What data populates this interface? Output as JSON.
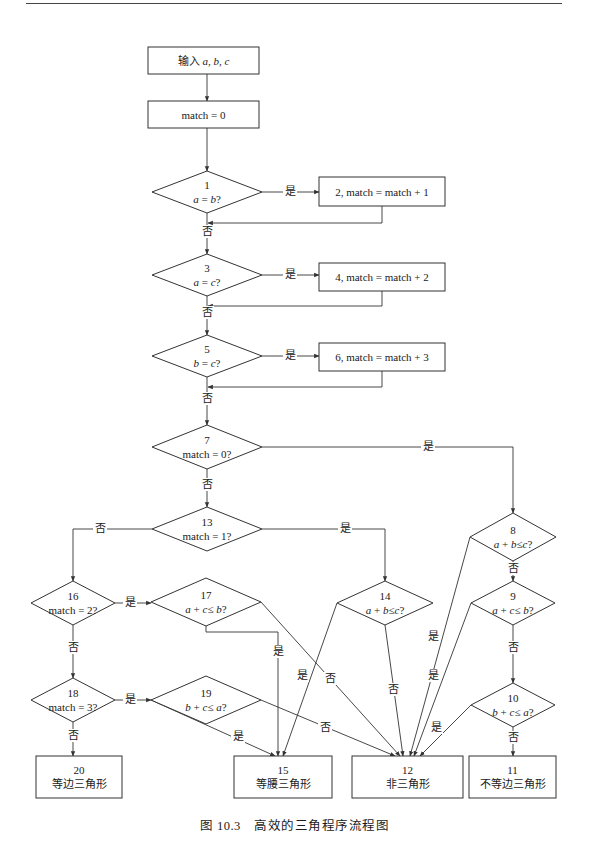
{
  "figure": {
    "caption": "图 10.3　高效的三角程序流程图"
  },
  "nodes": [
    {
      "id": "input",
      "type": "rect",
      "x": 148,
      "y": 47,
      "w": 111,
      "h": 27,
      "lines": [
        "输入 a, b, c"
      ]
    },
    {
      "id": "init",
      "type": "rect",
      "x": 148,
      "y": 101,
      "w": 111,
      "h": 27,
      "lines": [
        "match = 0"
      ]
    },
    {
      "id": "d1",
      "type": "diamond",
      "cx": 207,
      "cy": 192,
      "hw": 55,
      "hh": 21,
      "lines": [
        "1",
        "a = b?"
      ]
    },
    {
      "id": "p2",
      "type": "rect",
      "x": 319,
      "y": 177,
      "w": 126,
      "h": 29,
      "lines": [
        "2, match = match + 1"
      ]
    },
    {
      "id": "d3",
      "type": "diamond",
      "cx": 207,
      "cy": 275,
      "hw": 55,
      "hh": 21,
      "lines": [
        "3",
        "a = c?"
      ]
    },
    {
      "id": "p4",
      "type": "rect",
      "x": 319,
      "y": 263,
      "w": 126,
      "h": 28,
      "lines": [
        "4, match = match + 2"
      ]
    },
    {
      "id": "d5",
      "type": "diamond",
      "cx": 207,
      "cy": 356,
      "hw": 55,
      "hh": 21,
      "lines": [
        "5",
        "b = c?"
      ]
    },
    {
      "id": "p6",
      "type": "rect",
      "x": 319,
      "y": 343,
      "w": 126,
      "h": 28,
      "lines": [
        "6, match = match + 3"
      ]
    },
    {
      "id": "d7",
      "type": "diamond",
      "cx": 207,
      "cy": 447,
      "hw": 55,
      "hh": 22,
      "lines": [
        "7",
        "match = 0?"
      ]
    },
    {
      "id": "d13",
      "type": "diamond",
      "cx": 207,
      "cy": 529,
      "hw": 55,
      "hh": 22,
      "lines": [
        "13",
        "match = 1?"
      ]
    },
    {
      "id": "d8",
      "type": "diamond",
      "cx": 513,
      "cy": 537,
      "hw": 43,
      "hh": 24,
      "lines": [
        "8",
        "a + b≤c?"
      ]
    },
    {
      "id": "d9",
      "type": "diamond",
      "cx": 513,
      "cy": 603,
      "hw": 42,
      "hh": 22,
      "lines": [
        "9",
        "a + c≤ b?"
      ]
    },
    {
      "id": "d10",
      "type": "diamond",
      "cx": 513,
      "cy": 705,
      "hw": 42,
      "hh": 22,
      "lines": [
        "10",
        "b + c≤ a?"
      ]
    },
    {
      "id": "d14",
      "type": "diamond",
      "cx": 385,
      "cy": 603,
      "hw": 48,
      "hh": 22,
      "lines": [
        "14",
        "a + b≤c?"
      ]
    },
    {
      "id": "d16",
      "type": "diamond",
      "cx": 73,
      "cy": 603,
      "hw": 42,
      "hh": 22,
      "lines": [
        "16",
        "match = 2?"
      ]
    },
    {
      "id": "d17",
      "type": "diamond",
      "cx": 206,
      "cy": 602,
      "hw": 55,
      "hh": 24,
      "lines": [
        "17",
        "a + c≤ b?"
      ]
    },
    {
      "id": "d18",
      "type": "diamond",
      "cx": 73,
      "cy": 700,
      "hw": 42,
      "hh": 22,
      "lines": [
        "18",
        "match = 3?"
      ]
    },
    {
      "id": "d19",
      "type": "diamond",
      "cx": 206,
      "cy": 700,
      "hw": 55,
      "hh": 24,
      "lines": [
        "19",
        "b + c≤ a?"
      ]
    },
    {
      "id": "t20",
      "type": "rect",
      "x": 36,
      "y": 756,
      "w": 86,
      "h": 42,
      "lines": [
        "20",
        "等边三角形"
      ]
    },
    {
      "id": "t15",
      "type": "rect",
      "x": 234,
      "y": 756,
      "w": 98,
      "h": 42,
      "lines": [
        "15",
        "等腰三角形"
      ]
    },
    {
      "id": "t12",
      "type": "rect",
      "x": 352,
      "y": 756,
      "w": 111,
      "h": 42,
      "lines": [
        "12",
        "非三角形"
      ]
    },
    {
      "id": "t11",
      "type": "rect",
      "x": 469,
      "y": 756,
      "w": 87,
      "h": 42,
      "lines": [
        "11",
        "不等边三角形"
      ]
    }
  ],
  "edges": [
    {
      "pts": [
        [
          207,
          74
        ],
        [
          207,
          101
        ]
      ],
      "arrow": true
    },
    {
      "pts": [
        [
          207,
          128
        ],
        [
          207,
          171
        ]
      ],
      "arrow": true
    },
    {
      "pts": [
        [
          262,
          192
        ],
        [
          319,
          192
        ]
      ],
      "arrow": true,
      "label": "是",
      "lx": 290,
      "ly": 195
    },
    {
      "pts": [
        [
          382,
          206
        ],
        [
          382,
          223
        ],
        [
          208,
          223
        ]
      ],
      "arrow": true
    },
    {
      "pts": [
        [
          207,
          213
        ],
        [
          207,
          254
        ]
      ],
      "arrow": true,
      "label": "否",
      "lx": 207,
      "ly": 235
    },
    {
      "pts": [
        [
          262,
          275
        ],
        [
          319,
          275
        ]
      ],
      "arrow": true,
      "label": "是",
      "lx": 290,
      "ly": 278
    },
    {
      "pts": [
        [
          382,
          291
        ],
        [
          382,
          306
        ],
        [
          208,
          306
        ]
      ],
      "arrow": true
    },
    {
      "pts": [
        [
          207,
          296
        ],
        [
          207,
          335
        ]
      ],
      "arrow": true,
      "label": "否",
      "lx": 207,
      "ly": 316
    },
    {
      "pts": [
        [
          262,
          356
        ],
        [
          319,
          356
        ]
      ],
      "arrow": true,
      "label": "是",
      "lx": 290,
      "ly": 359
    },
    {
      "pts": [
        [
          382,
          371
        ],
        [
          382,
          387
        ],
        [
          208,
          387
        ]
      ],
      "arrow": true
    },
    {
      "pts": [
        [
          207,
          377
        ],
        [
          207,
          425
        ]
      ],
      "arrow": true,
      "label": "否",
      "lx": 207,
      "ly": 402
    },
    {
      "pts": [
        [
          262,
          447
        ],
        [
          513,
          447
        ],
        [
          513,
          513
        ]
      ],
      "arrow": true,
      "label": "是",
      "lx": 428,
      "ly": 450
    },
    {
      "pts": [
        [
          207,
          469
        ],
        [
          207,
          507
        ]
      ],
      "arrow": true,
      "label": "否",
      "lx": 207,
      "ly": 488
    },
    {
      "pts": [
        [
          152,
          529
        ],
        [
          73,
          529
        ],
        [
          73,
          581
        ]
      ],
      "arrow": true,
      "label": "否",
      "lx": 100,
      "ly": 532
    },
    {
      "pts": [
        [
          262,
          529
        ],
        [
          385,
          529
        ],
        [
          385,
          581
        ]
      ],
      "arrow": true,
      "label": "是",
      "lx": 345,
      "ly": 532
    },
    {
      "pts": [
        [
          513,
          561
        ],
        [
          513,
          581
        ]
      ],
      "arrow": true,
      "label": "否",
      "lx": 513,
      "ly": 572
    },
    {
      "pts": [
        [
          513,
          625
        ],
        [
          513,
          683
        ]
      ],
      "arrow": true,
      "label": "否",
      "lx": 513,
      "ly": 651
    },
    {
      "pts": [
        [
          513,
          727
        ],
        [
          513,
          756
        ]
      ],
      "arrow": true,
      "label": "否",
      "lx": 513,
      "ly": 741
    },
    {
      "pts": [
        [
          470,
          537
        ],
        [
          410,
          756
        ]
      ],
      "arrow": true,
      "label": "是",
      "lx": 433,
      "ly": 640
    },
    {
      "pts": [
        [
          471,
          603
        ],
        [
          414,
          756
        ]
      ],
      "arrow": true,
      "label": "是",
      "lx": 433,
      "ly": 679
    },
    {
      "pts": [
        [
          471,
          705
        ],
        [
          420,
          756
        ]
      ],
      "arrow": true,
      "label": "是",
      "lx": 436,
      "ly": 731
    },
    {
      "pts": [
        [
          115,
          603
        ],
        [
          151,
          603
        ]
      ],
      "arrow": true,
      "label": "是",
      "lx": 130,
      "ly": 606
    },
    {
      "pts": [
        [
          73,
          625
        ],
        [
          73,
          678
        ]
      ],
      "arrow": true,
      "label": "否",
      "lx": 73,
      "ly": 651
    },
    {
      "pts": [
        [
          115,
          700
        ],
        [
          151,
          700
        ]
      ],
      "arrow": true,
      "label": "是",
      "lx": 130,
      "ly": 703
    },
    {
      "pts": [
        [
          73,
          722
        ],
        [
          73,
          756
        ]
      ],
      "arrow": true,
      "label": "否",
      "lx": 73,
      "ly": 739
    },
    {
      "pts": [
        [
          206,
          626
        ],
        [
          206,
          632
        ],
        [
          278,
          632
        ],
        [
          278,
          756
        ]
      ],
      "arrow": true,
      "label": "是",
      "lx": 278,
      "ly": 655
    },
    {
      "pts": [
        [
          261,
          602
        ],
        [
          400,
          756
        ]
      ],
      "arrow": true,
      "label": "否",
      "lx": 330,
      "ly": 682
    },
    {
      "pts": [
        [
          337,
          603
        ],
        [
          283,
          756
        ]
      ],
      "arrow": true,
      "label": "是",
      "lx": 302,
      "ly": 679
    },
    {
      "pts": [
        [
          385,
          625
        ],
        [
          403,
          756
        ]
      ],
      "arrow": true,
      "label": "否",
      "lx": 393,
      "ly": 693
    },
    {
      "pts": [
        [
          261,
          700
        ],
        [
          395,
          756
        ]
      ],
      "arrow": true,
      "label": "否",
      "lx": 325,
      "ly": 731
    },
    {
      "pts": [
        [
          151,
          700
        ],
        [
          275,
          756
        ]
      ],
      "arrow": true,
      "label": "是",
      "lx": 238,
      "ly": 740
    }
  ],
  "italic_vars": [
    "a",
    "b",
    "c"
  ]
}
